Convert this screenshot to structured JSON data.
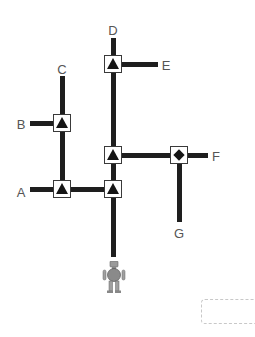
{
  "diagram": {
    "colors": {
      "track": "#1e1e1e",
      "node_border": "#3a3a3a",
      "symbol": "#151515",
      "label": "#555555",
      "robot_body": "#8a8a8a",
      "answer_border": "#c8c8c8"
    },
    "labels": {
      "A": "A",
      "B": "B",
      "C": "C",
      "D": "D",
      "E": "E",
      "F": "F",
      "G": "G"
    },
    "nodes": [
      {
        "id": "node-top",
        "symbol": "triangle",
        "x": 113,
        "y": 64
      },
      {
        "id": "node-mid-right",
        "symbol": "triangle",
        "x": 113,
        "y": 155
      },
      {
        "id": "node-bottom-right",
        "symbol": "triangle",
        "x": 113,
        "y": 189
      },
      {
        "id": "node-b",
        "symbol": "triangle",
        "x": 62,
        "y": 123
      },
      {
        "id": "node-bottom-left",
        "symbol": "triangle",
        "x": 62,
        "y": 189
      },
      {
        "id": "node-f",
        "symbol": "diamond",
        "x": 179,
        "y": 155
      }
    ],
    "robot": {
      "icon": "robot-icon",
      "x": 113,
      "y": 276
    },
    "answer_box": {
      "value": ""
    }
  }
}
